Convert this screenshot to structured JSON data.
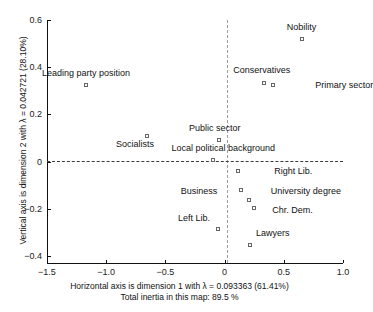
{
  "chart_data": {
    "type": "scatter",
    "title": "",
    "xlabel": "Horizontal axis is dimension 1 with λ = 0.093363 (61.41%)",
    "xlabel_line2": "Total inertia in this map: 89.5 %",
    "ylabel": "Vertical axis is dimension 2 with λ = 0.042721 (28.10%)",
    "xlim": [
      -1.5,
      1.0
    ],
    "ylim": [
      -0.45,
      0.62
    ],
    "xticks": [
      -1.5,
      -1.0,
      -0.5,
      0,
      0.5,
      1.0
    ],
    "xtick_labels": [
      "−1.5",
      "−1.0",
      "−0.5",
      "0",
      "0.5",
      "1.0"
    ],
    "yticks": [
      0.6,
      0.4,
      0.2,
      0,
      -0.2,
      -0.4
    ],
    "ytick_labels": [
      "0.6",
      "0.4",
      "0.2",
      "0",
      "−0.2",
      "−0.4"
    ],
    "grid": false,
    "legend": "none",
    "reference_lines": [
      {
        "axis": "vertical",
        "value": 0,
        "style": "dashed"
      },
      {
        "axis": "horizontal",
        "value": 0,
        "style": "dashed"
      }
    ],
    "marker_style": "open-square",
    "points": [
      {
        "label": "Nobility",
        "x": 0.65,
        "y": 0.52,
        "label_dx": 0,
        "label_dy": -12,
        "align": "center"
      },
      {
        "label": "Leading party position",
        "x": -1.17,
        "y": 0.325,
        "label_dx": 0,
        "label_dy": -12,
        "align": "center"
      },
      {
        "label": "Conservatives",
        "x": 0.33,
        "y": 0.335,
        "label_dx": -2,
        "label_dy": -13,
        "align": "center"
      },
      {
        "label": "Primary sector",
        "x": 0.41,
        "y": 0.325,
        "label_dx": 42,
        "label_dy": 0,
        "align": "left"
      },
      {
        "label": "Public sector",
        "x": -0.05,
        "y": 0.09,
        "label_dx": -4,
        "label_dy": -12,
        "align": "center"
      },
      {
        "label": "Socialists",
        "x": -0.655,
        "y": 0.11,
        "label_dx": -12,
        "label_dy": 8,
        "align": "center"
      },
      {
        "label": "Local political background",
        "x": -0.095,
        "y": 0.005,
        "label_dx": 10,
        "label_dy": -12,
        "align": "center"
      },
      {
        "label": "Right Lib.",
        "x": 0.115,
        "y": -0.04,
        "label_dx": 36,
        "label_dy": 0,
        "align": "left"
      },
      {
        "label": "Business",
        "x": 0.14,
        "y": -0.12,
        "label_dx": -24,
        "label_dy": 1,
        "align": "right"
      },
      {
        "label": "University degree",
        "x": 0.205,
        "y": -0.165,
        "label_dx": 22,
        "label_dy": -9,
        "align": "left"
      },
      {
        "label": "Chr. Dem.",
        "x": 0.25,
        "y": -0.195,
        "label_dx": 18,
        "label_dy": 2,
        "align": "left"
      },
      {
        "label": "Left Lib.",
        "x": -0.055,
        "y": -0.285,
        "label_dx": -8,
        "label_dy": -11,
        "align": "right"
      },
      {
        "label": "Lawyers",
        "x": 0.215,
        "y": -0.355,
        "label_dx": 6,
        "label_dy": -12,
        "align": "left"
      }
    ]
  }
}
